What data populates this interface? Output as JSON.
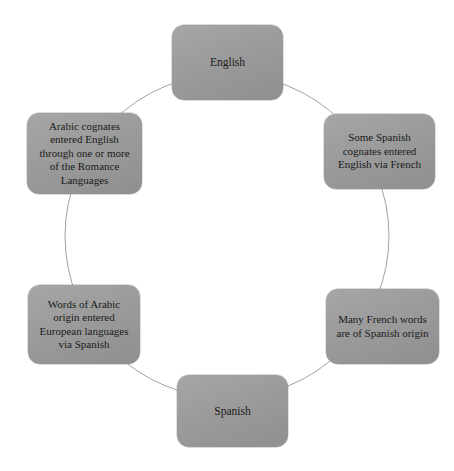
{
  "diagram": {
    "type": "cycle",
    "title": "",
    "colors": {
      "node_fill": "#9b9b9b",
      "node_fill_light": "#a6a6a6",
      "node_fill_dark": "#8f8f8f",
      "node_text": "#1a1a1a",
      "ring_stroke": "#a3a3a3",
      "background": "#ffffff"
    },
    "ring": {
      "center_x": 227,
      "center_y": 236,
      "radius": 162,
      "stroke_width": 1
    },
    "nodes": [
      {
        "id": "english",
        "label": "English",
        "position": "top"
      },
      {
        "id": "spanish-cognates-english-french",
        "label": "Some Spanish\ncognates entered\nEnglish via French",
        "position": "upper-right"
      },
      {
        "id": "french-words-spanish-origin",
        "label": "Many French words\nare of Spanish origin",
        "position": "lower-right"
      },
      {
        "id": "spanish",
        "label": "Spanish",
        "position": "bottom"
      },
      {
        "id": "arabic-origin-european-via-spanish",
        "label": "Words of Arabic\norigin entered\nEuropean languages\nvia Spanish",
        "position": "lower-left"
      },
      {
        "id": "arabic-cognates-english-romance",
        "label": "Arabic cognates\nentered English\nthrough one or more\nof the Romance\nLanguages",
        "position": "upper-left"
      }
    ]
  }
}
